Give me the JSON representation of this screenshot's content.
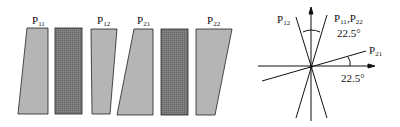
{
  "diagram": {
    "colors": {
      "light_fill": "#b5b5b5",
      "hatch_fill": "#6d6d6d",
      "stroke": "#222222"
    },
    "panels": [
      {
        "id": "P11",
        "label": "P",
        "sub": "11",
        "type": "prism"
      },
      {
        "id": "H1",
        "label": "",
        "sub": "",
        "type": "hatched"
      },
      {
        "id": "P12",
        "label": "P",
        "sub": "12",
        "type": "prism"
      },
      {
        "id": "P21",
        "label": "P",
        "sub": "21",
        "type": "prism"
      },
      {
        "id": "H2",
        "label": "",
        "sub": "",
        "type": "hatched"
      },
      {
        "id": "P22",
        "label": "P",
        "sub": "22",
        "type": "prism"
      }
    ],
    "axes": {
      "label_p12": {
        "main": "P",
        "sub": "12"
      },
      "label_p11_p22": {
        "main1": "P",
        "sub1": "11",
        "sep": ",",
        "main2": "P",
        "sub2": "22"
      },
      "label_p21": {
        "main": "P",
        "sub": "21"
      },
      "angle_top": "22.5°",
      "angle_right": "22.5°"
    }
  }
}
